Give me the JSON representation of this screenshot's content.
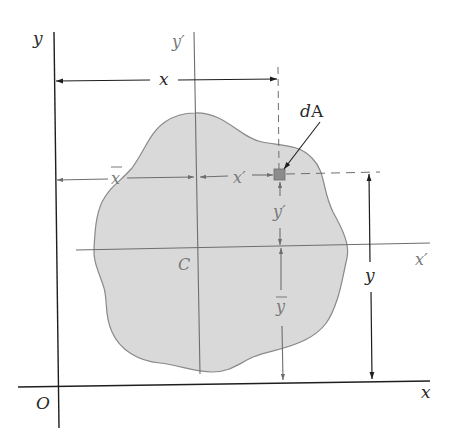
{
  "diagram": {
    "colors": {
      "background": "#ffffff",
      "area_fill": "#d9d9d9",
      "area_outline": "#8a8a8a",
      "axis_dark": "#1e1e1e",
      "axis_gray": "#6e6e6e",
      "element_fill": "#8c8c8c"
    },
    "labels": {
      "y_axis": "y",
      "y_prime_axis": "y′",
      "x_axis": "x",
      "x_prime_axis": "x′",
      "origin": "O",
      "centroid": "C",
      "element": "dA",
      "x_distance": "x",
      "x_bar": "x",
      "x_prime_distance": "x′",
      "y_prime_distance": "y′",
      "y_bar": "y",
      "y_distance": "y"
    },
    "nodes": [
      {
        "id": "O",
        "label": "O",
        "role": "origin"
      },
      {
        "id": "C",
        "label": "C",
        "role": "centroid"
      },
      {
        "id": "dA",
        "label": "dA",
        "role": "area element"
      }
    ],
    "axes": [
      {
        "id": "x",
        "label": "x",
        "through": "O",
        "direction": "horizontal"
      },
      {
        "id": "y",
        "label": "y",
        "through": "O",
        "direction": "vertical"
      },
      {
        "id": "x_prime",
        "label": "x′",
        "through": "C",
        "direction": "horizontal"
      },
      {
        "id": "y_prime",
        "label": "y′",
        "through": "C",
        "direction": "vertical"
      }
    ],
    "dimensions": [
      {
        "label": "x",
        "from": "y axis",
        "to": "dA",
        "direction": "horizontal"
      },
      {
        "label": "x̄",
        "from": "y axis",
        "to": "y′ axis",
        "direction": "horizontal"
      },
      {
        "label": "x′",
        "from": "y′ axis",
        "to": "dA",
        "direction": "horizontal"
      },
      {
        "label": "y′",
        "from": "x′ axis",
        "to": "dA",
        "direction": "vertical"
      },
      {
        "label": "ȳ",
        "from": "x axis",
        "to": "x′ axis",
        "direction": "vertical"
      },
      {
        "label": "y",
        "from": "x axis",
        "to": "dA",
        "direction": "vertical"
      }
    ]
  }
}
